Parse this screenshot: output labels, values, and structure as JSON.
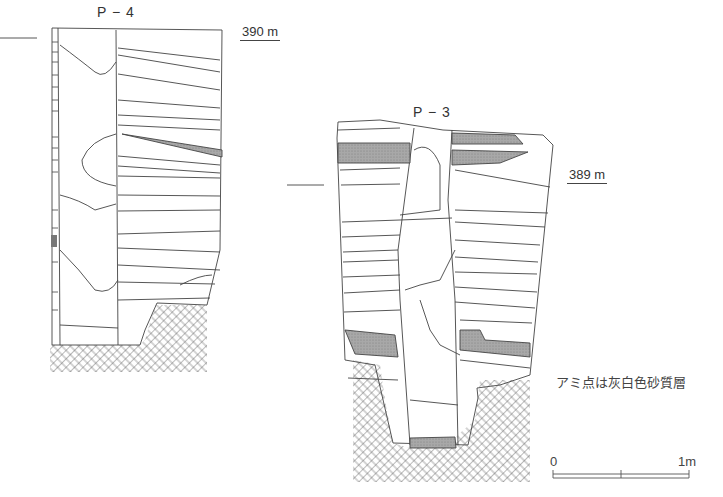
{
  "sections": [
    {
      "id": "P-4",
      "label": "P − 4",
      "elevation": "390 m"
    },
    {
      "id": "P-3",
      "label": "P − 3",
      "elevation": "389 m"
    }
  ],
  "legend": {
    "text": "アミ点は灰白色砂質層"
  },
  "scale_bar": {
    "start": "0",
    "end": "1m"
  },
  "colors": {
    "line": "#444444",
    "shade": "#9a9a9a",
    "hatch": "#555555"
  }
}
